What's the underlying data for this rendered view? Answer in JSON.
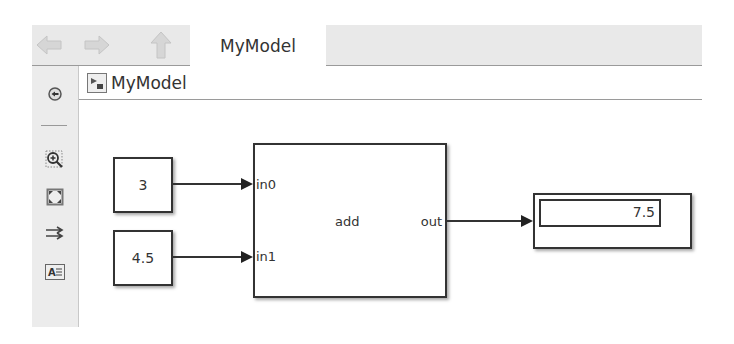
{
  "toolbar": {
    "back_icon": "back-arrow-icon",
    "forward_icon": "forward-arrow-icon",
    "up_icon": "up-arrow-icon",
    "tab_label": "MyModel"
  },
  "breadcrumb": {
    "model_icon": "simulink-model-icon",
    "label": "MyModel"
  },
  "sidebar": {
    "items": [
      {
        "name": "hide-browser",
        "icon": "collapse-circle-icon"
      },
      {
        "name": "zoom",
        "icon": "zoom-in-icon"
      },
      {
        "name": "fit-to-view",
        "icon": "fit-view-icon"
      },
      {
        "name": "signal-routing",
        "icon": "route-arrows-icon"
      },
      {
        "name": "annotation",
        "icon": "text-annotation-icon"
      }
    ]
  },
  "diagram": {
    "constants": [
      {
        "value": "3"
      },
      {
        "value": "4.5"
      }
    ],
    "add_block": {
      "label": "add",
      "inputs": [
        "in0",
        "in1"
      ],
      "output": "out"
    },
    "display_block": {
      "value": "7.5"
    }
  },
  "colors": {
    "toolbar_bg": "#e9e9e9",
    "sidebar_bg": "#ececec",
    "block_border": "#333333"
  }
}
